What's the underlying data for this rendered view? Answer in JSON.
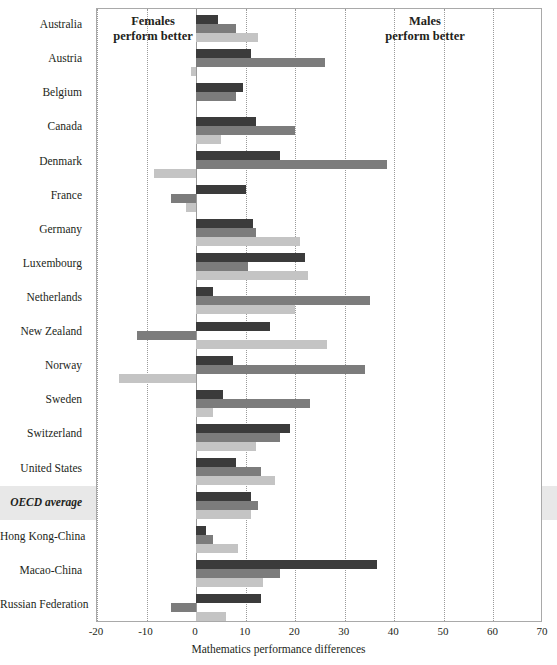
{
  "figure": {
    "annotations": {
      "females_label": "Females\nperform better",
      "males_label": "Males\nperform better"
    },
    "axis_title": "Mathematics performance differences"
  },
  "chart_data": {
    "type": "bar",
    "orientation": "horizontal",
    "title": "",
    "xlabel": "Mathematics performance differences",
    "ylabel": "",
    "xlim": [
      -20,
      70
    ],
    "xticks": [
      -20,
      -10,
      0,
      10,
      20,
      30,
      40,
      50,
      60,
      70
    ],
    "grid": true,
    "legend": "none",
    "highlight_category": "OECD average",
    "annotations": [
      {
        "text": "Females perform better",
        "side": "left"
      },
      {
        "text": "Males perform better",
        "side": "right"
      }
    ],
    "categories": [
      "Australia",
      "Austria",
      "Belgium",
      "Canada",
      "Denmark",
      "France",
      "Germany",
      "Luxembourg",
      "Netherlands",
      "New Zealand",
      "Norway",
      "Sweden",
      "Switzerland",
      "United States",
      "OECD average",
      "Hong Kong-China",
      "Macao-China",
      "Russian Federation"
    ],
    "series": [
      {
        "name": "series-1",
        "color": "#3b3b3b",
        "values": [
          4.5,
          11.0,
          9.5,
          12.0,
          17.0,
          10.0,
          11.5,
          22.0,
          3.5,
          15.0,
          7.5,
          5.5,
          19.0,
          8.0,
          11.0,
          2.0,
          36.5,
          13.0
        ]
      },
      {
        "name": "series-2",
        "color": "#7c7c7c",
        "values": [
          8.0,
          26.0,
          8.0,
          20.0,
          38.5,
          -5.0,
          12.0,
          10.5,
          35.0,
          -12.0,
          34.0,
          23.0,
          17.0,
          13.0,
          12.5,
          3.5,
          17.0,
          -5.0
        ]
      },
      {
        "name": "series-3",
        "color": "#c4c4c4",
        "values": [
          12.5,
          -1.0,
          0.0,
          5.0,
          -8.5,
          -2.0,
          21.0,
          22.5,
          20.0,
          26.5,
          -15.5,
          3.5,
          12.0,
          16.0,
          11.0,
          8.5,
          13.5,
          6.0
        ]
      }
    ]
  }
}
